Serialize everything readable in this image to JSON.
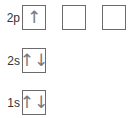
{
  "orbitals": [
    {
      "label": "2p",
      "boxes": [
        {
          "electrons": "↑"
        },
        {
          "electrons": ""
        },
        {
          "electrons": ""
        }
      ]
    },
    {
      "label": "2s",
      "boxes": [
        {
          "electrons": "↑↓"
        }
      ]
    },
    {
      "label": "1s",
      "boxes": [
        {
          "electrons": "↑↓"
        }
      ]
    }
  ]
}
